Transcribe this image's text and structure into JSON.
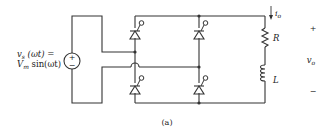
{
  "source": {
    "label_line1": "v",
    "label_line1_sub": "s",
    "label_line1_rest": " (ωt) =",
    "label_line2": "V",
    "label_line2_sub": "m",
    "label_line2_rest": " sin(ωt)",
    "plus": "+",
    "minus": "−"
  },
  "load": {
    "current_label": "i",
    "current_sub": "o",
    "resistor_label": "R",
    "inductor_label": "L"
  },
  "output_voltage": {
    "plus": "+",
    "label": "v",
    "label_sub": "o",
    "minus": "−"
  },
  "caption": "(a)",
  "colors": {
    "wire": "#333333",
    "text": "#222222"
  }
}
